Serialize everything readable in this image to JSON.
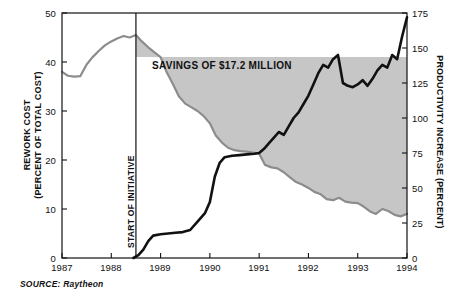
{
  "figure": {
    "source_note": "SOURCE: Raytheon",
    "band_label": "SAVINGS OF $17.2 MILLION",
    "initiative_label": "START OF INITIATIVE",
    "left_axis_title_line1": "REWORK COST",
    "left_axis_title_line2": "(PERCENT OF TOTAL COST)",
    "right_axis_title": "PRODUCTIVITY INCREASE (PERCENT)"
  },
  "colors": {
    "rework_line": "#8c8c8c",
    "productivity_line": "#111111",
    "savings_fill": "#c6c6c6",
    "frame": "#111111",
    "background": "#ffffff"
  },
  "chart_data": {
    "type": "line",
    "title": "",
    "subtitle": "",
    "xlabel": "",
    "ylabel": "REWORK COST (PERCENT OF TOTAL COST)",
    "y2label": "PRODUCTIVITY INCREASE (PERCENT)",
    "grid": false,
    "legend_position": "none",
    "xlim": [
      1987,
      1994
    ],
    "ylim": [
      0,
      50
    ],
    "y2lim": [
      0,
      175
    ],
    "xticks": [
      "1987",
      "1988",
      "1989",
      "1990",
      "1991",
      "1992",
      "1993",
      "1994"
    ],
    "yticks": [
      "0",
      "10",
      "20",
      "30",
      "40",
      "50"
    ],
    "y2ticks": [
      "0",
      "25",
      "50",
      "75",
      "100",
      "125",
      "150",
      "175"
    ],
    "annotations": [
      {
        "text": "START OF INITIATIVE",
        "type": "vertical-line",
        "x": 1988.5
      },
      {
        "text": "SAVINGS OF $17.2 MILLION",
        "type": "shaded-region",
        "x_start": 1988.5,
        "x_end": 1994.0,
        "upper_value": 41,
        "lower_series": "rework_cost"
      }
    ],
    "series": [
      {
        "name": "rework_cost",
        "axis": "left",
        "unit": "percent of total cost",
        "color": "#8c8c8c",
        "x": [
          1987.0,
          1987.12,
          1987.25,
          1987.37,
          1987.5,
          1987.62,
          1987.75,
          1987.87,
          1988.0,
          1988.12,
          1988.25,
          1988.37,
          1988.5,
          1988.62,
          1988.75,
          1988.87,
          1989.0,
          1989.12,
          1989.25,
          1989.37,
          1989.5,
          1989.62,
          1989.75,
          1989.87,
          1990.0,
          1990.12,
          1990.25,
          1990.37,
          1990.5,
          1990.62,
          1990.75,
          1990.87,
          1991.0,
          1991.12,
          1991.25,
          1991.37,
          1991.5,
          1991.62,
          1991.75,
          1991.87,
          1992.0,
          1992.12,
          1992.25,
          1992.37,
          1992.5,
          1992.62,
          1992.75,
          1992.87,
          1993.0,
          1993.12,
          1993.25,
          1993.37,
          1993.5,
          1993.62,
          1993.75,
          1993.87,
          1994.0
        ],
        "values": [
          38.0,
          37.2,
          37.0,
          37.1,
          39.5,
          41.0,
          42.3,
          43.4,
          44.2,
          44.8,
          45.3,
          45.0,
          45.5,
          44.2,
          43.0,
          42.0,
          41.0,
          38.0,
          35.5,
          33.0,
          31.5,
          30.8,
          30.0,
          29.0,
          27.5,
          25.0,
          23.5,
          22.5,
          22.0,
          21.8,
          21.7,
          21.5,
          21.3,
          19.0,
          18.5,
          18.3,
          17.5,
          16.5,
          15.5,
          15.0,
          14.3,
          13.5,
          13.0,
          12.0,
          11.8,
          12.3,
          11.5,
          11.3,
          11.2,
          10.5,
          9.5,
          9.0,
          10.0,
          9.6,
          8.8,
          8.5,
          9.0
        ]
      },
      {
        "name": "productivity_increase",
        "axis": "right",
        "unit": "percent",
        "color": "#111111",
        "x": [
          1988.45,
          1988.55,
          1988.65,
          1988.75,
          1988.85,
          1989.0,
          1989.15,
          1989.3,
          1989.45,
          1989.6,
          1989.75,
          1989.9,
          1990.0,
          1990.1,
          1990.2,
          1990.3,
          1990.45,
          1990.6,
          1990.75,
          1990.9,
          1991.0,
          1991.1,
          1991.2,
          1991.3,
          1991.4,
          1991.5,
          1991.6,
          1991.7,
          1991.8,
          1991.9,
          1992.0,
          1992.1,
          1992.2,
          1992.3,
          1992.4,
          1992.5,
          1992.6,
          1992.7,
          1992.8,
          1992.9,
          1993.0,
          1993.1,
          1993.2,
          1993.3,
          1993.4,
          1993.5,
          1993.6,
          1993.7,
          1993.8,
          1993.9,
          1994.0
        ],
        "values": [
          0,
          2,
          6,
          12,
          16,
          17,
          17.5,
          18,
          18.5,
          20,
          26,
          32,
          40,
          58,
          68,
          72,
          73,
          73.5,
          74,
          74.5,
          75,
          78,
          82,
          86,
          90,
          88,
          94,
          100,
          104,
          110,
          116,
          124,
          132,
          138,
          136,
          142,
          145,
          125,
          123,
          122,
          124,
          127,
          123,
          128,
          134,
          138,
          136,
          145,
          142,
          158,
          172
        ]
      }
    ]
  }
}
